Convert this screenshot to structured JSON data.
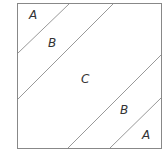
{
  "diagram": {
    "border_color": "#888888",
    "line_color": "#999999",
    "regions": [
      {
        "label": "A",
        "x": 33,
        "y": 19
      },
      {
        "label": "B",
        "x": 52,
        "y": 47
      },
      {
        "label": "C",
        "x": 85,
        "y": 83
      },
      {
        "label": "B",
        "x": 124,
        "y": 114
      },
      {
        "label": "A",
        "x": 146,
        "y": 138
      }
    ]
  }
}
